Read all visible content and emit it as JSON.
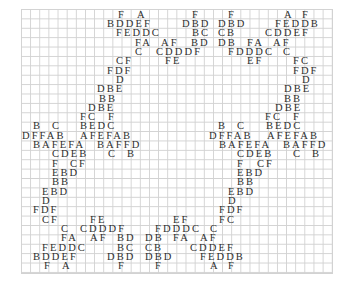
{
  "puzzle": {
    "type": "letter-grid-pattern",
    "grid_color": "#d2d2d2",
    "text_color": "#2e2e2e",
    "rows": [
      {
        "y": 9,
        "segments": [
          {
            "x": 118,
            "t": "F"
          },
          {
            "x": 137,
            "t": "A"
          },
          {
            "x": 192,
            "t": "F"
          },
          {
            "x": 228,
            "t": "F"
          },
          {
            "x": 284,
            "t": "A"
          },
          {
            "x": 302,
            "t": "F"
          }
        ]
      },
      {
        "y": 18,
        "segments": [
          {
            "x": 107,
            "t": "BDDEF"
          },
          {
            "x": 182,
            "t": "DBD"
          },
          {
            "x": 218,
            "t": "DBD"
          },
          {
            "x": 275,
            "t": "FEDDB"
          }
        ]
      },
      {
        "y": 27,
        "segments": [
          {
            "x": 116,
            "t": "FEDDC"
          },
          {
            "x": 192,
            "t": "BC"
          },
          {
            "x": 218,
            "t": "CB"
          },
          {
            "x": 265,
            "t": "CDDEF"
          }
        ]
      },
      {
        "y": 37,
        "segments": [
          {
            "x": 135,
            "t": "FA"
          },
          {
            "x": 161,
            "t": "AF"
          },
          {
            "x": 191,
            "t": "BD"
          },
          {
            "x": 218,
            "t": "DB"
          },
          {
            "x": 247,
            "t": "FA"
          },
          {
            "x": 273,
            "t": "AF"
          }
        ]
      },
      {
        "y": 46,
        "segments": [
          {
            "x": 135,
            "t": "C"
          },
          {
            "x": 156,
            "t": "CDDDF"
          },
          {
            "x": 228,
            "t": "FDDDC"
          },
          {
            "x": 283,
            "t": "C"
          }
        ]
      },
      {
        "y": 55,
        "segments": [
          {
            "x": 116,
            "t": "CF"
          },
          {
            "x": 165,
            "t": "FE"
          },
          {
            "x": 247,
            "t": "EF"
          },
          {
            "x": 293,
            "t": "FC"
          }
        ]
      },
      {
        "y": 65,
        "segments": [
          {
            "x": 107,
            "t": "FDF"
          },
          {
            "x": 293,
            "t": "FDF"
          }
        ]
      },
      {
        "y": 74,
        "segments": [
          {
            "x": 116,
            "t": "D"
          },
          {
            "x": 302,
            "t": "D"
          }
        ]
      },
      {
        "y": 83,
        "segments": [
          {
            "x": 97,
            "t": "DBE"
          },
          {
            "x": 284,
            "t": "DBE"
          }
        ]
      },
      {
        "y": 93,
        "segments": [
          {
            "x": 99,
            "t": "BB"
          },
          {
            "x": 284,
            "t": "BB"
          }
        ]
      },
      {
        "y": 102,
        "segments": [
          {
            "x": 88,
            "t": "DBE"
          },
          {
            "x": 275,
            "t": "DBE"
          }
        ]
      },
      {
        "y": 111,
        "segments": [
          {
            "x": 80,
            "t": "FC"
          },
          {
            "x": 108,
            "t": "F"
          },
          {
            "x": 265,
            "t": "FC"
          },
          {
            "x": 293,
            "t": "F"
          }
        ]
      },
      {
        "y": 120,
        "segments": [
          {
            "x": 33,
            "t": "B"
          },
          {
            "x": 52,
            "t": "C"
          },
          {
            "x": 80,
            "t": "BEDC"
          },
          {
            "x": 218,
            "t": "B"
          },
          {
            "x": 237,
            "t": "C"
          },
          {
            "x": 266,
            "t": "BEDC"
          }
        ]
      },
      {
        "y": 130,
        "segments": [
          {
            "x": 22,
            "t": "DFFAB"
          },
          {
            "x": 80,
            "t": "AFEFAB"
          },
          {
            "x": 209,
            "t": "DFFAB"
          },
          {
            "x": 267,
            "t": "AFEFAB"
          }
        ]
      },
      {
        "y": 139,
        "segments": [
          {
            "x": 33,
            "t": "BAFEFA"
          },
          {
            "x": 97,
            "t": "BAFFD"
          },
          {
            "x": 219,
            "t": "BAFEFA"
          },
          {
            "x": 283,
            "t": "BAFFD"
          }
        ]
      },
      {
        "y": 148,
        "segments": [
          {
            "x": 52,
            "t": "CDEB"
          },
          {
            "x": 108,
            "t": "C"
          },
          {
            "x": 127,
            "t": "B"
          },
          {
            "x": 237,
            "t": "CDEB"
          },
          {
            "x": 293,
            "t": "C"
          },
          {
            "x": 312,
            "t": "B"
          }
        ]
      },
      {
        "y": 158,
        "segments": [
          {
            "x": 52,
            "t": "F"
          },
          {
            "x": 70,
            "t": "CF"
          },
          {
            "x": 237,
            "t": "F"
          },
          {
            "x": 257,
            "t": "CF"
          }
        ]
      },
      {
        "y": 167,
        "segments": [
          {
            "x": 52,
            "t": "EBD"
          },
          {
            "x": 237,
            "t": "EBD"
          }
        ]
      },
      {
        "y": 176,
        "segments": [
          {
            "x": 52,
            "t": "BB"
          },
          {
            "x": 237,
            "t": "BB"
          }
        ]
      },
      {
        "y": 186,
        "segments": [
          {
            "x": 42,
            "t": "EBD"
          },
          {
            "x": 228,
            "t": "EBD"
          }
        ]
      },
      {
        "y": 195,
        "segments": [
          {
            "x": 42,
            "t": "D"
          },
          {
            "x": 228,
            "t": "D"
          }
        ]
      },
      {
        "y": 204,
        "segments": [
          {
            "x": 33,
            "t": "FDF"
          },
          {
            "x": 219,
            "t": "FDF"
          }
        ]
      },
      {
        "y": 214,
        "segments": [
          {
            "x": 42,
            "t": "CF"
          },
          {
            "x": 90,
            "t": "FE"
          },
          {
            "x": 173,
            "t": "EF"
          },
          {
            "x": 219,
            "t": "FC"
          }
        ]
      },
      {
        "y": 223,
        "segments": [
          {
            "x": 61,
            "t": "C"
          },
          {
            "x": 80,
            "t": "CDDDF"
          },
          {
            "x": 155,
            "t": "FDDDC"
          },
          {
            "x": 210,
            "t": "C"
          }
        ]
      },
      {
        "y": 232,
        "segments": [
          {
            "x": 61,
            "t": "FA"
          },
          {
            "x": 90,
            "t": "AF"
          },
          {
            "x": 117,
            "t": "BD"
          },
          {
            "x": 145,
            "t": "DB"
          },
          {
            "x": 173,
            "t": "FA"
          },
          {
            "x": 200,
            "t": "AF"
          }
        ]
      },
      {
        "y": 242,
        "segments": [
          {
            "x": 42,
            "t": "FEDDC"
          },
          {
            "x": 117,
            "t": "BC"
          },
          {
            "x": 145,
            "t": "CB"
          },
          {
            "x": 190,
            "t": "CDDEF"
          }
        ]
      },
      {
        "y": 251,
        "segments": [
          {
            "x": 33,
            "t": "BDDEF"
          },
          {
            "x": 107,
            "t": "DBD"
          },
          {
            "x": 145,
            "t": "DBD"
          },
          {
            "x": 200,
            "t": "FEDDB"
          }
        ]
      },
      {
        "y": 260,
        "segments": [
          {
            "x": 44,
            "t": "F"
          },
          {
            "x": 62,
            "t": "A"
          },
          {
            "x": 118,
            "t": "F"
          },
          {
            "x": 155,
            "t": "F"
          },
          {
            "x": 210,
            "t": "A"
          },
          {
            "x": 228,
            "t": "F"
          }
        ]
      }
    ]
  }
}
